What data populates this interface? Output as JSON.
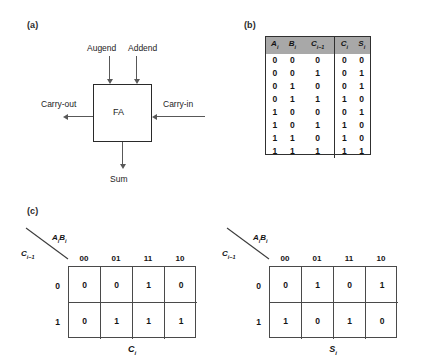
{
  "figure": {
    "panels": [
      {
        "id": "a",
        "label": "(a)"
      },
      {
        "id": "b",
        "label": "(b)"
      },
      {
        "id": "c",
        "label": "(c)"
      }
    ]
  },
  "block_diagram": {
    "box_label": "FA",
    "inputs_top": [
      "Augend",
      "Addend"
    ],
    "input_right": "Carry-in",
    "output_left": "Carry-out",
    "output_bottom": "Sum"
  },
  "truth_table": {
    "headers_left": [
      "A",
      "B",
      "C"
    ],
    "headers_left_sub": [
      "i",
      "i",
      "i−1"
    ],
    "headers_right": [
      "C",
      "S"
    ],
    "headers_right_sub": [
      "i",
      "i"
    ],
    "rows": [
      {
        "inputs": [
          "0",
          "0",
          "0"
        ],
        "outputs": [
          "0",
          "0"
        ]
      },
      {
        "inputs": [
          "0",
          "0",
          "1"
        ],
        "outputs": [
          "0",
          "1"
        ]
      },
      {
        "inputs": [
          "0",
          "1",
          "0"
        ],
        "outputs": [
          "0",
          "1"
        ]
      },
      {
        "inputs": [
          "0",
          "1",
          "1"
        ],
        "outputs": [
          "1",
          "0"
        ]
      },
      {
        "inputs": [
          "1",
          "0",
          "0"
        ],
        "outputs": [
          "0",
          "1"
        ]
      },
      {
        "inputs": [
          "1",
          "0",
          "1"
        ],
        "outputs": [
          "1",
          "0"
        ]
      },
      {
        "inputs": [
          "1",
          "1",
          "0"
        ],
        "outputs": [
          "1",
          "0"
        ]
      },
      {
        "inputs": [
          "1",
          "1",
          "1"
        ],
        "outputs": [
          "1",
          "1"
        ]
      }
    ]
  },
  "kmaps": [
    {
      "name": "carry",
      "col_var": "AiBi",
      "row_var": "Ci-1",
      "col_labels": [
        "00",
        "01",
        "11",
        "10"
      ],
      "row_labels": [
        "0",
        "1"
      ],
      "caption": "Ci",
      "cells": [
        [
          "0",
          "0",
          "1",
          "0"
        ],
        [
          "0",
          "1",
          "1",
          "1"
        ]
      ]
    },
    {
      "name": "sum",
      "col_var": "AiBi",
      "row_var": "Ci-1",
      "col_labels": [
        "00",
        "01",
        "11",
        "10"
      ],
      "row_labels": [
        "0",
        "1"
      ],
      "caption": "Si",
      "cells": [
        [
          "0",
          "1",
          "0",
          "1"
        ],
        [
          "1",
          "0",
          "1",
          "0"
        ]
      ]
    }
  ],
  "colors": {
    "ink": "#1a1a1a",
    "line": "#585858",
    "table_border": "#303030",
    "header_fill": "#a8a8a8",
    "grid_line": "#4a4a4a",
    "background": "#ffffff"
  }
}
